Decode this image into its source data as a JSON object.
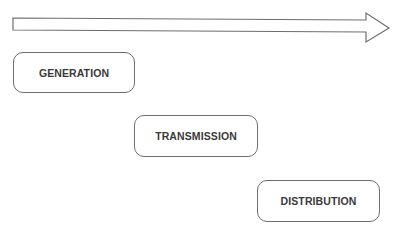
{
  "diagram": {
    "type": "process-flow",
    "arrow": {
      "direction": "right",
      "stroke_color": "#6e6e6e",
      "fill_color": "#ffffff"
    },
    "stages": [
      {
        "label": "GENERATION",
        "order": 1
      },
      {
        "label": "TRANSMISSION",
        "order": 2
      },
      {
        "label": "DISTRIBUTION",
        "order": 3
      }
    ],
    "colors": {
      "border": "#6e6e6e",
      "text": "#3a3a3a",
      "background": "#ffffff"
    }
  }
}
